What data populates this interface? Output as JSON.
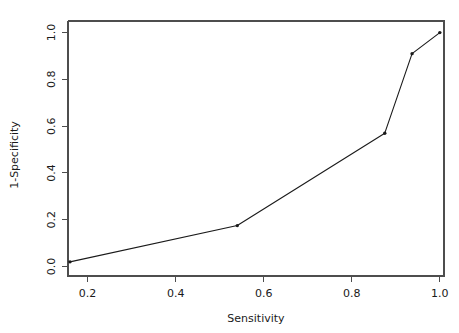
{
  "figure": {
    "width": 459,
    "height": 333,
    "background_color": "#ffffff",
    "plot_box": {
      "left": 68,
      "top": 21,
      "right": 444,
      "bottom": 276
    },
    "axis_color": "#4d4d4d",
    "data_color": "#1a1a1a"
  },
  "chart_data": {
    "type": "line",
    "title": "",
    "xlabel": "Sensitivity",
    "ylabel": "1-Specificity",
    "xlim": [
      0.1555,
      1.0095
    ],
    "ylim": [
      -0.0405,
      1.0495
    ],
    "xticks": [
      0.2,
      0.4,
      0.6,
      0.8,
      1.0
    ],
    "xtick_labels": [
      "0.2",
      "0.4",
      "0.6",
      "0.8",
      "1.0"
    ],
    "yticks": [
      0.0,
      0.2,
      0.4,
      0.6,
      0.8,
      1.0
    ],
    "ytick_labels": [
      "0.0",
      "0.2",
      "0.4",
      "0.6",
      "0.8",
      "1.0"
    ],
    "grid": false,
    "legend": null,
    "markers": "points",
    "x": [
      0.16,
      0.54,
      0.875,
      0.937,
      1.0
    ],
    "y": [
      0.02,
      0.175,
      0.57,
      0.91,
      1.0
    ],
    "series": [
      {
        "name": "ROC curve",
        "points": [
          {
            "x": 0.16,
            "y": 0.02
          },
          {
            "x": 0.54,
            "y": 0.175
          },
          {
            "x": 0.875,
            "y": 0.57
          },
          {
            "x": 0.937,
            "y": 0.91
          },
          {
            "x": 1.0,
            "y": 1.0
          }
        ]
      }
    ]
  }
}
